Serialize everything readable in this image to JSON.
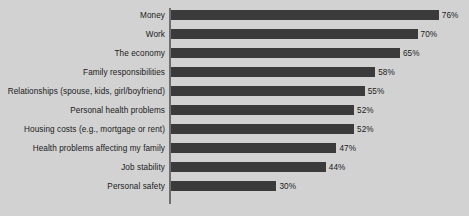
{
  "chart_data": {
    "type": "bar",
    "orientation": "horizontal",
    "title": "",
    "subtitle": "",
    "xlabel": "",
    "ylabel": "",
    "xlim": [
      0,
      76
    ],
    "grid": false,
    "legend": false,
    "value_suffix": "%",
    "categories": [
      "Money",
      "Work",
      "The economy",
      "Family responsibilities",
      "Relationships (spouse, kids, girl/boyfriend)",
      "Personal health problems",
      "Housing costs (e.g., mortgage or rent)",
      "Health problems affecting my family",
      "Job stability",
      "Personal safety"
    ],
    "values": [
      76,
      70,
      65,
      58,
      55,
      52,
      52,
      47,
      44,
      30
    ],
    "value_labels": [
      "76%",
      "70%",
      "65%",
      "58%",
      "55%",
      "52%",
      "52%",
      "47%",
      "44%",
      "30%"
    ],
    "series": [
      {
        "name": "",
        "values": [
          76,
          70,
          65,
          58,
          55,
          52,
          52,
          47,
          44,
          30
        ]
      }
    ],
    "colors": {
      "background": "#d2d2d2",
      "bar": "#3b3b3b",
      "axis": "#6e6e6e",
      "text": "#1a1a1a"
    },
    "geometry": {
      "axis_x": 169,
      "px_per_unit": 3.53,
      "row_pitch": 19,
      "bar_height": 10,
      "first_row_top": 10
    }
  }
}
